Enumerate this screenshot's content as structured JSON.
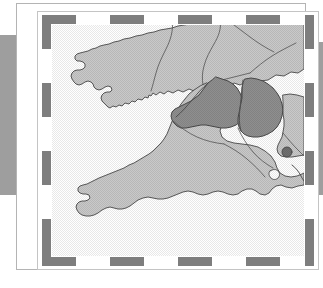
{
  "figure": {
    "kind": "map",
    "title": "",
    "caption": "",
    "region_name": "South West England and Wales"
  },
  "colors": {
    "page_background": "#ffffff",
    "bleed_block": "#9e9e9e",
    "frame_line": "#b4b4b4",
    "inner_frame_line": "#c4c4c4",
    "neatline_dark": "#7e7e7e",
    "neatline_light": "#ffffff",
    "land_light": "#c9c9c9",
    "land_highlight": "#8f8f8f",
    "coast_line": "#4a4a4a",
    "county_line": "#555555",
    "marker_fill": "#6f6f6f",
    "sea": "#ffffff"
  },
  "neatline": {
    "segment_length": 34,
    "band_thickness": 9,
    "top_segments": [
      "dark",
      "light",
      "dark",
      "light",
      "dark",
      "light",
      "dark",
      "light"
    ],
    "bottom_segments": [
      "dark",
      "light",
      "dark",
      "light",
      "dark",
      "light",
      "dark",
      "light"
    ],
    "left_segments": [
      "dark",
      "light",
      "dark",
      "light",
      "dark",
      "light",
      "dark"
    ],
    "right_segments": [
      "dark",
      "light",
      "dark",
      "light",
      "dark",
      "light",
      "dark"
    ]
  },
  "map": {
    "width": 252,
    "height": 231,
    "areas": [
      {
        "id": "wales",
        "name": "Wales",
        "shade": "light",
        "label": ""
      },
      {
        "id": "cornwall-devon",
        "name": "Cornwall and Devon",
        "shade": "light",
        "label": ""
      },
      {
        "id": "somerset",
        "name": "Somerset",
        "shade": "highlight",
        "label": ""
      },
      {
        "id": "wiltshire",
        "name": "Wiltshire",
        "shade": "highlight",
        "label": ""
      },
      {
        "id": "dorset-hampshire",
        "name": "Dorset and Hampshire",
        "shade": "light",
        "label": ""
      }
    ],
    "markers": [
      {
        "id": "site-marker",
        "name": "study site",
        "x": 235,
        "y": 127,
        "radius": 5,
        "label": ""
      }
    ],
    "paths": {
      "land_outer": "M 196,0 L 196,0 C 196,0 196,0 196,0 Z",
      "notes": "geometry carried in template SVG"
    }
  }
}
